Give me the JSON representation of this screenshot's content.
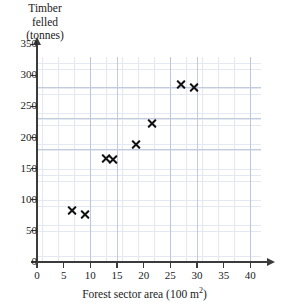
{
  "chart_data": {
    "type": "scatter",
    "title": "",
    "ylabel": "Timber\nfelled\n(tonnes)",
    "xlabel_main": "Forest sector area (100 m",
    "xlabel_sup": "2",
    "xlabel_close": ")",
    "xlabel_full": "Forest sector area (100 m2)",
    "xlim": [
      0,
      43
    ],
    "ylim": [
      0,
      365
    ],
    "xticks": [
      0,
      5,
      10,
      15,
      20,
      25,
      30,
      35,
      40
    ],
    "yticks": [
      0,
      50,
      100,
      150,
      200,
      250,
      300,
      350
    ],
    "grid": true,
    "grid_minor_spacing_x": 1,
    "grid_minor_spacing_y": 10,
    "grid_major_spacing_x": 5,
    "grid_major_spacing_y": 50,
    "legend": "none",
    "marker": "x-cross",
    "marker_color": "#111111",
    "grid_color": "#cfd8e6",
    "axis_color": "#3b3b3b",
    "points": [
      {
        "x": 6.5,
        "y": 82
      },
      {
        "x": 9.0,
        "y": 76
      },
      {
        "x": 13.0,
        "y": 166
      },
      {
        "x": 14.3,
        "y": 165
      },
      {
        "x": 18.5,
        "y": 188
      },
      {
        "x": 21.5,
        "y": 222
      },
      {
        "x": 27.0,
        "y": 285
      },
      {
        "x": 29.5,
        "y": 280
      }
    ]
  }
}
